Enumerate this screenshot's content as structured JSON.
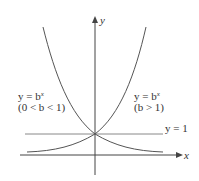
{
  "figure": {
    "axes": {
      "x_label": "x",
      "y_label": "y"
    },
    "horizontal_line": {
      "label": "y = 1"
    },
    "curves": [
      {
        "name": "decreasing",
        "equation_prefix": "y = b",
        "exponent": "x",
        "condition": "(0 < b < 1)"
      },
      {
        "name": "increasing",
        "equation_prefix": "y = b",
        "exponent": "x",
        "condition": "(b > 1)"
      }
    ],
    "colors": {
      "curve": "#555555",
      "axis": "#444444",
      "line": "#888888",
      "text": "#333333"
    }
  }
}
